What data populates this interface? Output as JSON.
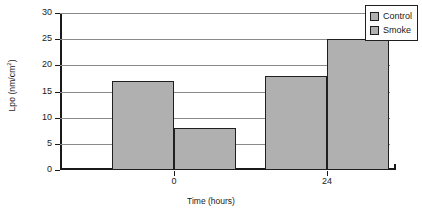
{
  "chart_data": {
    "type": "bar",
    "title": "",
    "xlabel": "Time (hours)",
    "ylabel": "Lpo (nm/cm²)",
    "ylabel_base": "Lpo (nm/cm",
    "ylabel_sup": "2",
    "ylabel_tail": ")",
    "categories": [
      "0",
      "24"
    ],
    "series": [
      {
        "name": "Control",
        "values": [
          17,
          18
        ]
      },
      {
        "name": "Smoke",
        "values": [
          8,
          25
        ]
      }
    ],
    "ylim": [
      0,
      30
    ],
    "ytick_labels": [
      "30",
      "25",
      "20",
      "15",
      "10",
      "5",
      "0"
    ],
    "ytick_values": [
      30,
      25,
      20,
      15,
      10,
      5,
      0
    ],
    "grid": true,
    "legend_position": "top-right",
    "colors": {
      "bar_fill": "#b0b0b0",
      "bar_edge": "#1f1f1f",
      "gridline": "#8a8a8a",
      "axis": "#1a1a1a",
      "background": "#ffffff"
    }
  },
  "legend": {
    "entries": [
      {
        "label": "Control"
      },
      {
        "label": "Smoke"
      }
    ]
  }
}
